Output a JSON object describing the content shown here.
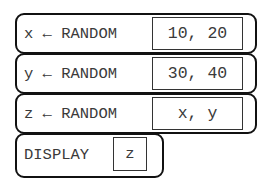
{
  "blocks": [
    {
      "type": "assignment",
      "variable": "x",
      "arrow": "←",
      "procedure": "RANDOM",
      "statement": "x ← RANDOM",
      "argument": "10, 20"
    },
    {
      "type": "assignment",
      "variable": "y",
      "arrow": "←",
      "procedure": "RANDOM",
      "statement": "y ← RANDOM",
      "argument": "30, 40"
    },
    {
      "type": "assignment",
      "variable": "z",
      "arrow": "←",
      "procedure": "RANDOM",
      "statement": "z ← RANDOM",
      "argument": "x, y"
    },
    {
      "type": "display",
      "procedure": "DISPLAY",
      "statement": "DISPLAY",
      "argument": "z"
    }
  ]
}
